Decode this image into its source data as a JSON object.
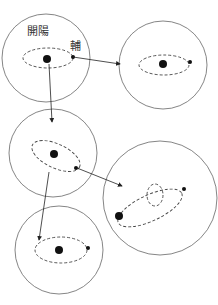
{
  "labels": {
    "kaiyang": "開陽",
    "fu": "輔"
  },
  "diagram": {
    "panels": [
      {
        "id": "panel-1",
        "note": "primary with dashed orbit and companion; labeled"
      },
      {
        "id": "panel-2",
        "note": "horizontal orbit view"
      },
      {
        "id": "panel-3",
        "note": "tilted orbit view"
      },
      {
        "id": "panel-4",
        "note": "two overlapping dashed orbits"
      },
      {
        "id": "panel-5",
        "note": "horizontal orbit, bottom"
      }
    ],
    "colors": {
      "stroke": "#555555",
      "dot": "#111111",
      "background": "#ffffff"
    }
  }
}
